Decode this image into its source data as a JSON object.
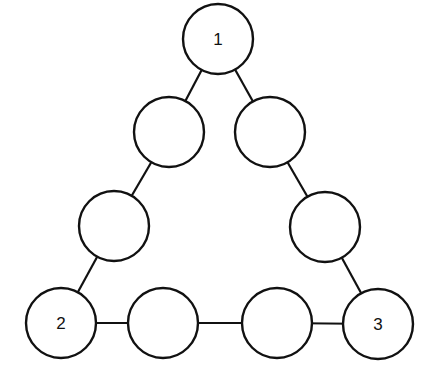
{
  "diagram": {
    "type": "triangle-of-circles",
    "nodes": [
      {
        "id": "n1",
        "label": "1",
        "cx": 218,
        "cy": 39,
        "r": 35,
        "position": "top-corner"
      },
      {
        "id": "l1",
        "label": "",
        "cx": 169,
        "cy": 132,
        "r": 35,
        "position": "left-side-upper"
      },
      {
        "id": "r1",
        "label": "",
        "cx": 270,
        "cy": 132,
        "r": 35,
        "position": "right-side-upper"
      },
      {
        "id": "l2",
        "label": "",
        "cx": 114,
        "cy": 226,
        "r": 35,
        "position": "left-side-lower"
      },
      {
        "id": "r2",
        "label": "",
        "cx": 325,
        "cy": 227,
        "r": 35,
        "position": "right-side-lower"
      },
      {
        "id": "n2",
        "label": "2",
        "cx": 61,
        "cy": 323,
        "r": 35,
        "position": "bottom-left-corner"
      },
      {
        "id": "b1",
        "label": "",
        "cx": 163,
        "cy": 323,
        "r": 35,
        "position": "bottom-side-left"
      },
      {
        "id": "b2",
        "label": "",
        "cx": 277,
        "cy": 323,
        "r": 35,
        "position": "bottom-side-right"
      },
      {
        "id": "n3",
        "label": "3",
        "cx": 378,
        "cy": 324,
        "r": 35,
        "position": "bottom-right-corner"
      }
    ],
    "edges": [
      {
        "from": "n1",
        "to": "l1"
      },
      {
        "from": "l1",
        "to": "l2"
      },
      {
        "from": "l2",
        "to": "n2"
      },
      {
        "from": "n1",
        "to": "r1"
      },
      {
        "from": "r1",
        "to": "r2"
      },
      {
        "from": "r2",
        "to": "n3"
      },
      {
        "from": "n2",
        "to": "b1"
      },
      {
        "from": "b1",
        "to": "b2"
      },
      {
        "from": "b2",
        "to": "n3"
      }
    ],
    "colors": {
      "stroke": "#111111",
      "fill": "#ffffff",
      "background": "#ffffff"
    }
  }
}
